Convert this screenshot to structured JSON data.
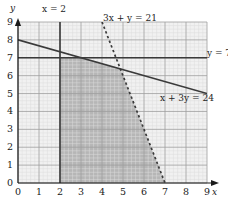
{
  "chart_data": {
    "type": "line",
    "title": "",
    "xlabel": "x",
    "ylabel": "y",
    "xlim": [
      0,
      9
    ],
    "ylim": [
      0,
      9
    ],
    "grid": true,
    "minor_grid_divisions": 5,
    "xticks": [
      "0",
      "1",
      "2",
      "3",
      "4",
      "5",
      "6",
      "7",
      "8",
      "9"
    ],
    "yticks": [
      "0",
      "1",
      "2",
      "3",
      "4",
      "5",
      "6",
      "7",
      "8",
      "9"
    ],
    "legend_position": "inline-annotations",
    "series": [
      {
        "name": "x = 2",
        "label": "x = 2",
        "style": "solid",
        "equation": "x = 2",
        "points": [
          [
            2,
            0
          ],
          [
            2,
            9
          ]
        ],
        "color": "#3a3a3a"
      },
      {
        "name": "y = 7",
        "label": "y = 7",
        "style": "solid",
        "equation": "y = 7",
        "points": [
          [
            0,
            7
          ],
          [
            9,
            7
          ]
        ],
        "color": "#3a3a3a"
      },
      {
        "name": "x + 3y = 24",
        "label": "x + 3y = 24",
        "style": "solid",
        "equation": "x + 3y = 24",
        "points": [
          [
            0,
            8
          ],
          [
            9,
            5
          ]
        ],
        "color": "#3a3a3a"
      },
      {
        "name": "3x + y = 21",
        "label": "3x + y = 21",
        "style": "dashed",
        "equation": "3x + y = 21",
        "points": [
          [
            4,
            9
          ],
          [
            7,
            0
          ]
        ],
        "color": "#3a3a3a"
      }
    ],
    "shaded_region": {
      "name": "feasible-region",
      "fill": "#b6b6b6",
      "vertices": [
        [
          2,
          0
        ],
        [
          2,
          7
        ],
        [
          3,
          7
        ],
        [
          4.875,
          6.375
        ],
        [
          7,
          0
        ]
      ]
    },
    "annotations": [
      {
        "id": "ann-x2",
        "text": "x = 2",
        "x": 2.0,
        "y": 9.6
      },
      {
        "id": "ann-3xy",
        "text": "3x + y = 21",
        "x": 4.45,
        "y": 8.85
      },
      {
        "id": "ann-y7",
        "text": "y = 7",
        "x": 9.15,
        "y": 7.0
      },
      {
        "id": "ann-x3y",
        "text": "x + 3y = 24",
        "x": 6.7,
        "y": 4.6
      }
    ],
    "colors": {
      "shaded_fill": "#b6b6b6",
      "unshaded_fill": "#f1f1f1",
      "major_grid": "#9a9a9a",
      "minor_grid": "#d8d8d8",
      "line": "#3a3a3a",
      "axis": "#1a1a1a",
      "text": "#1a1a1a"
    }
  },
  "axes": {
    "x_name": "x",
    "y_name": "y"
  },
  "labels": {
    "x_equals_2": "x = 2",
    "three_x_plus_y": "3x + y = 21",
    "y_equals_7": "y = 7",
    "x_plus_3y": "x + 3y = 24"
  },
  "ticks": {
    "x": [
      "0",
      "1",
      "2",
      "3",
      "4",
      "5",
      "6",
      "7",
      "8",
      "9"
    ],
    "y": [
      "0",
      "1",
      "2",
      "3",
      "4",
      "5",
      "6",
      "7",
      "8",
      "9"
    ]
  }
}
